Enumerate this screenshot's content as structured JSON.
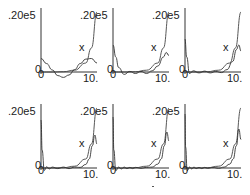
{
  "chart_data": [
    {
      "type": "line",
      "panel": 1,
      "ylabel_top": ".20e5",
      "x_origin_label": "0",
      "y_origin_label": "0",
      "x_end_label": "10.",
      "marker": "x",
      "xlim": [
        0,
        10
      ],
      "ylim": [
        0,
        20000
      ],
      "series": [
        {
          "name": "exact",
          "x": [
            0,
            2,
            4,
            6,
            8,
            9,
            10
          ],
          "y": [
            0,
            0,
            100,
            600,
            3000,
            8000,
            20000
          ]
        },
        {
          "name": "approx",
          "x": [
            0,
            1,
            2,
            3,
            4,
            5,
            6,
            7,
            8,
            9,
            10
          ],
          "y": [
            4500,
            2800,
            700,
            -1200,
            -1800,
            -1000,
            800,
            2800,
            4300,
            4500,
            3000
          ]
        }
      ]
    },
    {
      "type": "line",
      "panel": 2,
      "ylabel_top": ".20e5",
      "x_origin_label": "0",
      "y_origin_label": "0",
      "x_end_label": "10.",
      "marker": "x",
      "xlim": [
        0,
        10
      ],
      "ylim": [
        0,
        20000
      ],
      "series": [
        {
          "name": "exact",
          "x": [
            0,
            2,
            4,
            6,
            8,
            9,
            10
          ],
          "y": [
            0,
            0,
            100,
            600,
            3000,
            8000,
            20000
          ]
        },
        {
          "name": "approx",
          "x": [
            0,
            0.5,
            1,
            2,
            3,
            4,
            5,
            6,
            7,
            8,
            9,
            9.5,
            10
          ],
          "y": [
            9000,
            5000,
            1500,
            -800,
            200,
            -500,
            200,
            -500,
            400,
            2000,
            5000,
            6500,
            5500
          ]
        }
      ]
    },
    {
      "type": "line",
      "panel": 3,
      "ylabel_top": ".20e5",
      "x_origin_label": "0",
      "y_origin_label": "0",
      "x_end_label": "10.",
      "marker": "x",
      "xlim": [
        0,
        10
      ],
      "ylim": [
        0,
        20000
      ],
      "series": [
        {
          "name": "exact",
          "x": [
            0,
            2,
            4,
            6,
            8,
            9,
            10
          ],
          "y": [
            0,
            0,
            100,
            600,
            3000,
            8000,
            20000
          ]
        },
        {
          "name": "approx",
          "x": [
            0,
            0.3,
            0.8,
            1.5,
            2.5,
            3.5,
            4.5,
            5.5,
            6.5,
            7.5,
            8.5,
            9.2,
            9.6,
            10
          ],
          "y": [
            11000,
            5000,
            -500,
            400,
            -300,
            300,
            -300,
            200,
            -200,
            800,
            3500,
            7500,
            9000,
            7000
          ]
        }
      ]
    },
    {
      "type": "line",
      "panel": 4,
      "ylabel_top": ".20e5",
      "x_origin_label": "0",
      "y_origin_label": "0",
      "x_end_label": "10.",
      "marker": "x",
      "xlim": [
        0,
        10
      ],
      "ylim": [
        0,
        20000
      ],
      "series": [
        {
          "name": "exact",
          "x": [
            0,
            2,
            4,
            6,
            8,
            9,
            10
          ],
          "y": [
            0,
            0,
            100,
            600,
            3000,
            8000,
            20000
          ]
        },
        {
          "name": "approx",
          "x": [
            0,
            0.2,
            0.6,
            1,
            1.5,
            2,
            3,
            4,
            5,
            6,
            7,
            8,
            8.6,
            9.2,
            9.6,
            10
          ],
          "y": [
            16000,
            6000,
            -800,
            400,
            -300,
            300,
            -200,
            300,
            -200,
            300,
            200,
            1200,
            3000,
            7500,
            11000,
            8000
          ]
        }
      ]
    },
    {
      "type": "line",
      "panel": 5,
      "ylabel_top": ".20e5",
      "x_origin_label": "0",
      "y_origin_label": "0",
      "x_end_label": "10.",
      "marker": "x",
      "xlim": [
        0,
        10
      ],
      "ylim": [
        0,
        20000
      ],
      "series": [
        {
          "name": "exact",
          "x": [
            0,
            2,
            4,
            6,
            8,
            9,
            10
          ],
          "y": [
            0,
            0,
            100,
            600,
            3000,
            8000,
            20000
          ]
        },
        {
          "name": "approx",
          "x": [
            0,
            0.15,
            0.5,
            1,
            1.5,
            2,
            2.5,
            3,
            3.5,
            4,
            5,
            6,
            7,
            8,
            8.6,
            9.2,
            9.6,
            10
          ],
          "y": [
            17000,
            6000,
            -900,
            300,
            -300,
            300,
            -200,
            200,
            -200,
            200,
            -100,
            200,
            300,
            1300,
            3000,
            7500,
            12000,
            9000
          ]
        }
      ]
    },
    {
      "type": "line",
      "panel": 6,
      "ylabel_top": ".20e5",
      "x_origin_label": "0",
      "y_origin_label": "0",
      "x_end_label": "10.",
      "marker": "x",
      "xlim": [
        0,
        10
      ],
      "ylim": [
        0,
        20000
      ],
      "series": [
        {
          "name": "exact",
          "x": [
            0,
            2,
            4,
            6,
            8,
            9,
            10
          ],
          "y": [
            0,
            0,
            100,
            600,
            3000,
            8000,
            20000
          ]
        },
        {
          "name": "approx",
          "x": [
            0,
            0.1,
            0.4,
            0.8,
            1.2,
            1.6,
            2,
            2.5,
            3,
            3.5,
            4,
            5,
            6,
            7,
            8,
            8.6,
            9.2,
            9.6,
            10
          ],
          "y": [
            18000,
            7000,
            -900,
            300,
            -300,
            300,
            -200,
            200,
            -200,
            200,
            -100,
            200,
            -100,
            300,
            1300,
            3000,
            7500,
            13000,
            9500
          ]
        }
      ]
    }
  ],
  "panels": [
    {
      "ytop": ".20e5",
      "zero": "0",
      "xzero": "0",
      "xend": "10.",
      "marker": "x"
    },
    {
      "ytop": ".20e5",
      "zero": "0",
      "xzero": "0",
      "xend": "10.",
      "marker": "x"
    },
    {
      "ytop": ".20e5",
      "zero": "0",
      "xzero": "0",
      "xend": "10.",
      "marker": "x"
    },
    {
      "ytop": ".20e5",
      "zero": "0",
      "xzero": "0",
      "xend": "10.",
      "marker": "x"
    },
    {
      "ytop": ".20e5",
      "zero": "0",
      "xzero": "0",
      "xend": "10.",
      "marker": "x"
    },
    {
      "ytop": ".20e5",
      "zero": "0",
      "xzero": "0",
      "xend": "10.",
      "marker": "x"
    }
  ]
}
